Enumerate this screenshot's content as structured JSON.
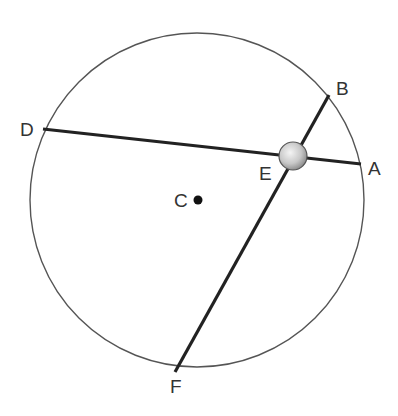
{
  "diagram": {
    "circle": {
      "center_label": "C",
      "cx": 197,
      "cy": 200,
      "r": 167,
      "stroke": "#555555"
    },
    "points": {
      "A": {
        "label": "A",
        "x": 361,
        "y": 164
      },
      "B": {
        "label": "B",
        "x": 329,
        "y": 95
      },
      "D": {
        "label": "D",
        "x": 43,
        "y": 129
      },
      "E": {
        "label": "E",
        "x": 293,
        "y": 155
      },
      "F": {
        "label": "F",
        "x": 175,
        "y": 372
      },
      "C": {
        "label": "C",
        "x": 198,
        "y": 200
      }
    },
    "chords": [
      {
        "name": "DA",
        "from": "D",
        "to": "A"
      },
      {
        "name": "BF",
        "from": "B",
        "to": "F"
      }
    ],
    "intersection_marker": {
      "at": "E",
      "type": "shaded-sphere",
      "r": 14
    },
    "line_color": "#222222"
  }
}
